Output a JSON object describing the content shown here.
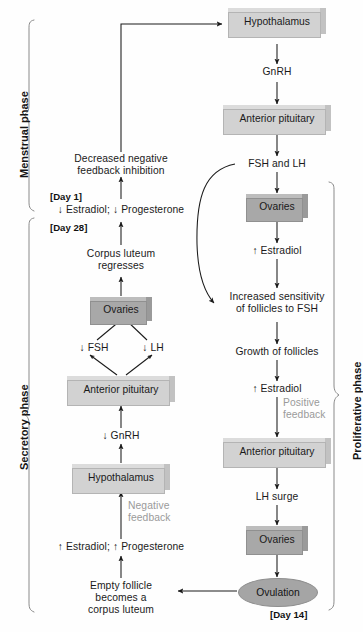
{
  "diagram": {
    "colors": {
      "box_light": "#d2d2d2",
      "box_dark": "#a8a8a8",
      "ellipse": "#a5a5a5",
      "gray_text": "#9a9a9a",
      "line": "#1a1a1a"
    }
  },
  "phases": {
    "menstrual": "Menstrual phase",
    "secretory": "Secretory phase",
    "proliferative": "Proliferative phase"
  },
  "days": {
    "day1": "[Day 1]",
    "day28": "[Day 28]",
    "day14": "[Day 14]"
  },
  "nodes": {
    "hypothalamus_top": "Hypothalamus",
    "gnrh_top": "GnRH",
    "anterior_pituitary_top": "Anterior pituitary",
    "fsh_and_lh": "FSH and LH",
    "ovaries_top": "Ovaries",
    "estradiol_up_1": "↑ Estradiol",
    "increased_sensitivity": "Increased sensitivity\nof follicles to FSH",
    "increased_sensitivity_l1": "Increased sensitivity",
    "increased_sensitivity_l2": "of follicles to FSH",
    "growth_of_follicles": "Growth of follicles",
    "estradiol_up_2": "↑ Estradiol",
    "positive_feedback_l1": "Positive",
    "positive_feedback_l2": "feedback",
    "anterior_pituitary_right": "Anterior pituitary",
    "lh_surge": "LH surge",
    "ovaries_right": "Ovaries",
    "ovulation": "Ovulation",
    "empty_follicle_l1": "Empty follicle",
    "empty_follicle_l2": "becomes a",
    "empty_follicle_l3": "corpus luteum",
    "estradiol_progesterone_up": "↑ Estradiol; ↑ Progesterone",
    "negative_feedback_l1": "Negative",
    "negative_feedback_l2": "feedback",
    "hypothalamus_left": "Hypothalamus",
    "gnrh_down": "↓ GnRH",
    "anterior_pituitary_left": "Anterior pituitary",
    "fsh_down": "↓ FSH",
    "lh_down": "↓ LH",
    "ovaries_left": "Ovaries",
    "corpus_luteum_l1": "Corpus luteum",
    "corpus_luteum_l2": "regresses",
    "estradiol_progesterone_down": "↓ Estradiol; ↓ Progesterone",
    "decreased_feedback_l1": "Decreased negative",
    "decreased_feedback_l2": "feedback inhibition"
  }
}
